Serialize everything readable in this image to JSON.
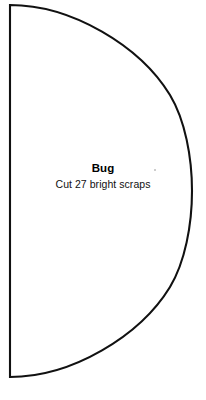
{
  "sheet": {
    "width": 206,
    "height": 400,
    "background_color": "#ffffff"
  },
  "pattern_piece": {
    "name": "Bug",
    "instruction": "Cut 27 bright scraps",
    "shape": "half-ellipse",
    "outline_color": "#111111",
    "fill_color": "#ffffff",
    "stroke_width_px": 2,
    "flat_edge_x": 10,
    "top_y": 5,
    "bottom_y": 377,
    "apex_x": 192,
    "apex_y": 191
  },
  "artifact": {
    "label": "scan-speck",
    "color": "#bdbdbd"
  }
}
